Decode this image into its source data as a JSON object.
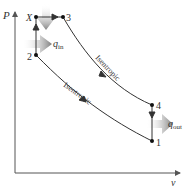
{
  "diagram": {
    "type": "P-v diagram",
    "axes": {
      "y_label": "P",
      "x_label": "v"
    },
    "states": [
      {
        "id": "X",
        "label": "X"
      },
      {
        "id": "3",
        "label": "3"
      },
      {
        "id": "2",
        "label": "2"
      },
      {
        "id": "4",
        "label": "4"
      },
      {
        "id": "1",
        "label": "1"
      }
    ],
    "processes": [
      {
        "from": "2",
        "to": "X",
        "kind": "constant volume"
      },
      {
        "from": "X",
        "to": "3",
        "kind": "constant pressure"
      },
      {
        "from": "3",
        "to": "4",
        "kind": "isentropic",
        "label": "Isentropic"
      },
      {
        "from": "4",
        "to": "1",
        "kind": "constant volume"
      },
      {
        "from": "1",
        "to": "2",
        "kind": "isentropic",
        "label": "Isentropic"
      }
    ],
    "heat": {
      "in": {
        "symbol": "q",
        "subscript": "in"
      },
      "out": {
        "symbol": "q",
        "subscript": "out"
      }
    },
    "colors": {
      "line": "#333333",
      "heat_arrow": "#7a7a7a",
      "axis": "#555555"
    }
  }
}
